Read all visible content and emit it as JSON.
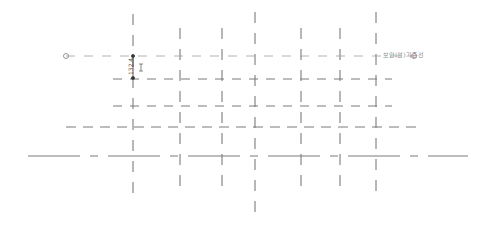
{
  "drawing": {
    "type": "grid-layout-plan",
    "colors": {
      "grid_line": "#707070",
      "dashed_line": "#9a9a9a",
      "label": "#8a8a8a",
      "background": "#ffffff"
    },
    "vertical_grid_x": [
      133,
      180,
      222,
      255,
      301,
      340,
      376
    ],
    "horizontal_grid_y": [
      56,
      79,
      106,
      127,
      156
    ],
    "reference_line": {
      "label": "보안(설)기준선",
      "y": 56,
      "x_start": 66,
      "x_end": 414
    },
    "dimension": {
      "value": "132.4",
      "x": 133,
      "y_top": 56,
      "y_bottom": 78
    },
    "markers": [
      {
        "x": 133,
        "y": 56
      },
      {
        "x": 133,
        "y": 78
      }
    ],
    "end_circles": [
      {
        "x": 66,
        "y": 56
      },
      {
        "x": 414,
        "y": 56
      }
    ]
  }
}
